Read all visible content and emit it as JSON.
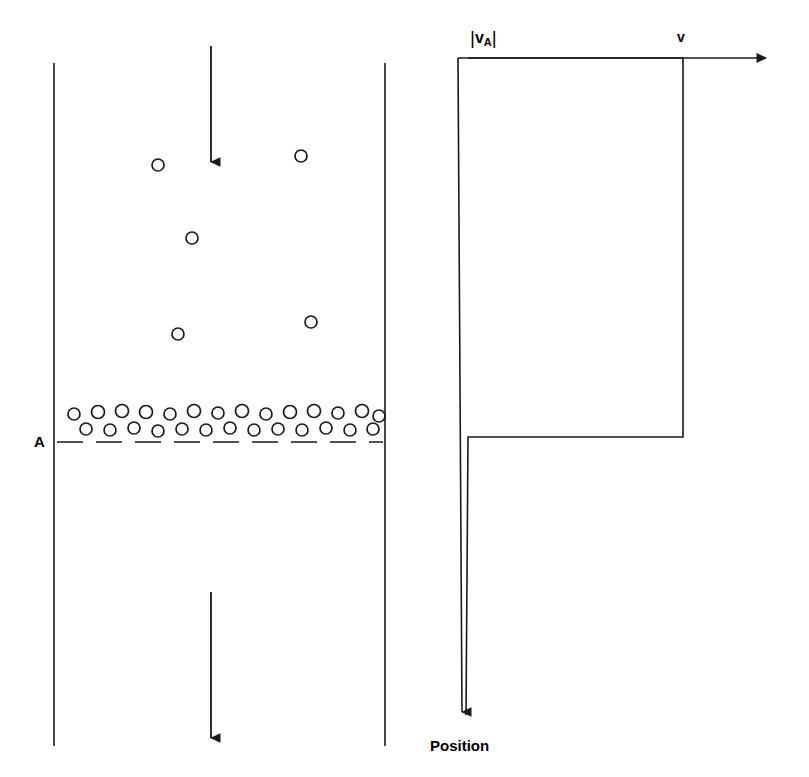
{
  "figure": {
    "stroke_color": "#1a1a1a",
    "background_color": "#ffffff"
  },
  "pipe": {
    "name": "vertical-pipe",
    "left_wall_x": 54,
    "right_wall_x": 385,
    "top_y": 63,
    "bottom_y": 746,
    "inlet_arrow": {
      "label": "",
      "x": 211,
      "y_start": 46,
      "y_end": 172
    },
    "outlet_arrow": {
      "label": "",
      "x": 211,
      "y_start": 592,
      "y_end": 748
    },
    "section_a": {
      "label": "A",
      "y": 442,
      "dash_x_start": 57,
      "dash_x_end": 383
    },
    "bubbles_scattered": [
      {
        "cx": 158,
        "cy": 165,
        "r": 6
      },
      {
        "cx": 301,
        "cy": 156,
        "r": 6
      },
      {
        "cx": 192,
        "cy": 238,
        "r": 6
      },
      {
        "cx": 178,
        "cy": 334,
        "r": 6
      },
      {
        "cx": 311,
        "cy": 322,
        "r": 6
      }
    ],
    "bubble_band": {
      "top_row_y": 414,
      "bottom_row_y": 429,
      "radius": 6,
      "top_row_x": [
        74,
        98,
        122,
        146,
        170,
        194,
        218,
        242,
        266,
        290,
        314,
        338,
        362,
        380
      ],
      "bottom_row_x": [
        86,
        110,
        134,
        158,
        182,
        206,
        230,
        254,
        278,
        302,
        326,
        350,
        374
      ]
    }
  },
  "graph": {
    "name": "velocity-profile-plot",
    "axis_horizontal": {
      "y": 58,
      "x_start": 458,
      "x_end": 775,
      "arrow": "right"
    },
    "axis_vertical": {
      "x": 458,
      "y_start": 58,
      "y_end": 722,
      "arrow": "down"
    },
    "labels": {
      "y_axis": "|v",
      "y_axis_sub": "A",
      "y_axis_close": "|",
      "velocity": "v",
      "x_axis": "Position"
    },
    "curve": {
      "description": "step profile: high plateau then drop to low plateau",
      "points": [
        {
          "x": 468,
          "y": 58
        },
        {
          "x": 683,
          "y": 58
        },
        {
          "x": 683,
          "y": 437
        },
        {
          "x": 468,
          "y": 437
        },
        {
          "x": 468,
          "y": 715
        }
      ],
      "high_level_y": 58,
      "low_level_y": 437,
      "step_x": 683
    }
  }
}
